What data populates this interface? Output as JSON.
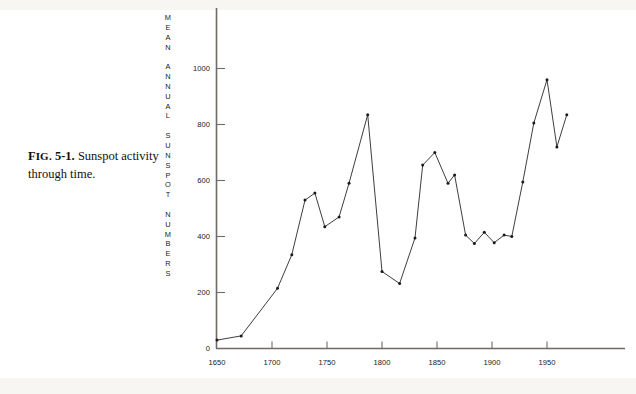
{
  "figure": {
    "caption_label": "FIG. 5-1.",
    "caption_label_prefix": "F",
    "caption_label_smallcaps": "IG.",
    "caption_label_number": " 5-1.",
    "caption_text": " Sunspot activity through time."
  },
  "axis": {
    "y_title": "MEAN ANNUAL SUNSPOT NUMBERS",
    "y_title_letters": [
      "M",
      "E",
      "A",
      "N",
      "",
      "A",
      "N",
      "N",
      "U",
      "A",
      "L",
      "",
      "S",
      "U",
      "N",
      "S",
      "P",
      "O",
      "T",
      "",
      "N",
      "U",
      "M",
      "B",
      "E",
      "R",
      "S"
    ],
    "y_ticks": [
      "0",
      "200",
      "400",
      "600",
      "800",
      "1000"
    ],
    "x_ticks": [
      "1650",
      "1700",
      "1750",
      "1800",
      "1850",
      "1900",
      "1950"
    ]
  },
  "colors": {
    "line": "#2b2724",
    "axis": "#6f6a64",
    "text": "#1b1917",
    "background": "#ffffff"
  },
  "chart_data": {
    "type": "line",
    "title": "Sunspot activity through time",
    "xlabel": "",
    "ylabel": "MEAN ANNUAL SUNSPOT NUMBERS",
    "xlim": [
      1645,
      1975
    ],
    "ylim": [
      0,
      1100
    ],
    "grid": false,
    "legend": "none",
    "marker": "dot",
    "x": [
      1650,
      1672,
      1705,
      1718,
      1730,
      1739,
      1748,
      1761,
      1770,
      1779,
      1787,
      1800,
      1816,
      1830,
      1837,
      1848,
      1860,
      1870,
      1883,
      1893,
      1905,
      1917,
      1928,
      1937,
      1947,
      1957,
      1968
    ],
    "y": [
      30,
      45,
      215,
      335,
      530,
      555,
      435,
      470,
      590,
      835,
      275,
      232,
      655,
      700,
      590,
      620,
      405,
      375,
      415,
      400,
      595,
      805,
      960,
      720,
      835
    ],
    "points": [
      {
        "year": 1650,
        "value": 30
      },
      {
        "year": 1672,
        "value": 45
      },
      {
        "year": 1705,
        "value": 215
      },
      {
        "year": 1718,
        "value": 335
      },
      {
        "year": 1730,
        "value": 530
      },
      {
        "year": 1739,
        "value": 555
      },
      {
        "year": 1748,
        "value": 435
      },
      {
        "year": 1761,
        "value": 470
      },
      {
        "year": 1770,
        "value": 590
      },
      {
        "year": 1787,
        "value": 835
      },
      {
        "year": 1800,
        "value": 275
      },
      {
        "year": 1816,
        "value": 232
      },
      {
        "year": 1830,
        "value": 395
      },
      {
        "year": 1837,
        "value": 655
      },
      {
        "year": 1848,
        "value": 700
      },
      {
        "year": 1860,
        "value": 590
      },
      {
        "year": 1866,
        "value": 620
      },
      {
        "year": 1876,
        "value": 405
      },
      {
        "year": 1884,
        "value": 375
      },
      {
        "year": 1893,
        "value": 415
      },
      {
        "year": 1902,
        "value": 378
      },
      {
        "year": 1911,
        "value": 405
      },
      {
        "year": 1918,
        "value": 400
      },
      {
        "year": 1928,
        "value": 595
      },
      {
        "year": 1938,
        "value": 805
      },
      {
        "year": 1950,
        "value": 960
      },
      {
        "year": 1959,
        "value": 720
      },
      {
        "year": 1968,
        "value": 835
      }
    ]
  }
}
